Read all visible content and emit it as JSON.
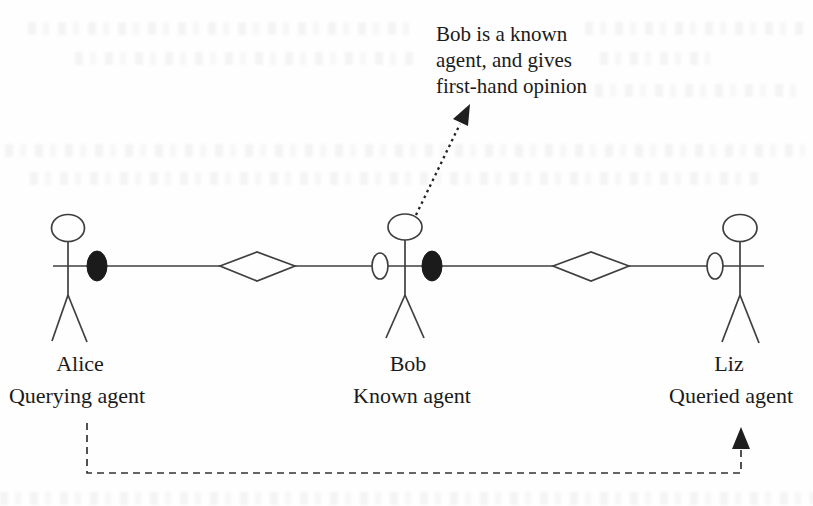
{
  "diagram": {
    "annotation": {
      "line1": "Bob is a known",
      "line2": "agent, and gives",
      "line3": "first-hand opinion"
    },
    "agents": [
      {
        "name": "Alice",
        "role": "Querying agent"
      },
      {
        "name": "Bob",
        "role": "Known agent"
      },
      {
        "name": "Liz",
        "role": "Queried agent"
      }
    ],
    "nodes": {
      "filled_node_meaning": "filled-ellipse-node",
      "open_node_meaning": "open-ellipse-node",
      "diamond_meaning": "relation-diamond"
    },
    "colors": {
      "line": "#3f3f3f",
      "text": "#1b1b1b",
      "filled_node": "#1b1b1b",
      "open_node_fill": "#fefefe",
      "background": "#fefefe"
    }
  }
}
